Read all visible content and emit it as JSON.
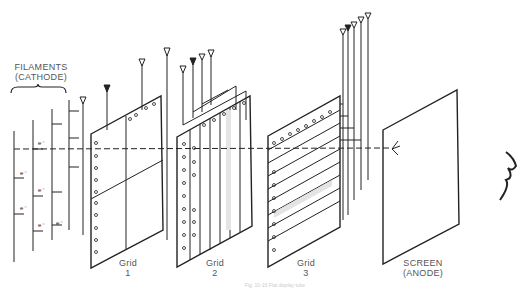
{
  "diagram": {
    "labels": {
      "filaments": "FILAMENTS",
      "cathode": "(CATHODE)",
      "grid1_name": "Grid",
      "grid1_num": "1",
      "grid2_name": "Grid",
      "grid2_num": "2",
      "grid3_name": "Grid",
      "grid3_num": "3",
      "screen": "SCREEN",
      "anode": "(ANODE)"
    },
    "electron_symbol": "e⁻",
    "caption": "Fig. 10-16  Flat display tube"
  }
}
